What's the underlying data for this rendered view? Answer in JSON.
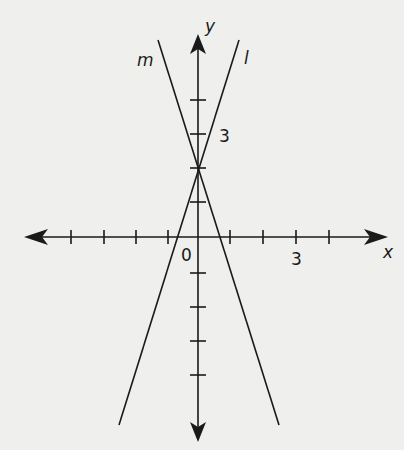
{
  "diagram": {
    "type": "coordinate-plane",
    "axes": {
      "x_label": "x",
      "y_label": "y",
      "origin_label": "0",
      "x_tick_label": "3",
      "y_tick_label": "3",
      "x_ticks": [
        -5,
        -4,
        -3,
        -2,
        -1,
        1,
        2,
        3,
        4
      ],
      "y_ticks": [
        -5,
        -4,
        -3,
        -2,
        -1,
        1,
        2,
        3,
        4
      ]
    },
    "lines": [
      {
        "name": "l",
        "label": "l",
        "y_intercept": 2,
        "x_intercept": -0.7,
        "slope": "positive"
      },
      {
        "name": "m",
        "label": "m",
        "y_intercept": 2,
        "x_intercept": 0.7,
        "slope": "negative"
      }
    ],
    "intersection": {
      "x": 0,
      "y": 2
    }
  }
}
